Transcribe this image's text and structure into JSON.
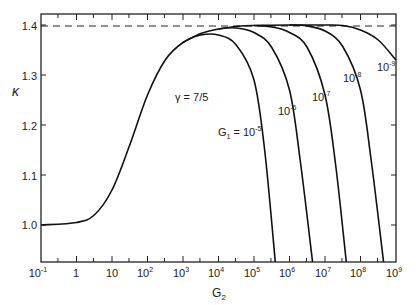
{
  "chart_data": {
    "type": "line",
    "title": "",
    "xlabel": "G2",
    "ylabel": "κ",
    "xscale": "log",
    "xlim": [
      0.1,
      1000000000.0
    ],
    "ylim": [
      0.926,
      1.425
    ],
    "x_ticks": [
      "10^-1",
      "1",
      "10",
      "10^2",
      "10^3",
      "10^4",
      "10^5",
      "10^6",
      "10^7",
      "10^8",
      "10^9"
    ],
    "y_ticks": [
      "1.0",
      "1.1",
      "1.2",
      "1.3",
      "1.4"
    ],
    "grid": false,
    "reference_line": {
      "y": 1.4,
      "style": "dashed"
    },
    "annotations": [
      "γ = 7/5",
      "G1 = 10^-5",
      "10^-6",
      "10^-7",
      "10^-8",
      "10^-9"
    ],
    "series": [
      {
        "name": "G1 = 10^-5",
        "log10_x": [
          -1,
          0,
          0.5,
          1,
          1.5,
          2,
          2.5,
          3,
          3.5,
          4,
          4.5,
          5,
          5.3,
          5.6
        ],
        "y": [
          1.0,
          1.005,
          1.02,
          1.07,
          1.16,
          1.26,
          1.33,
          1.365,
          1.38,
          1.38,
          1.36,
          1.29,
          1.15,
          0.926
        ]
      },
      {
        "name": "G1 = 10^-6",
        "log10_x": [
          3,
          3.5,
          4,
          4.5,
          5,
          5.5,
          6,
          6.3,
          6.65
        ],
        "y": [
          1.365,
          1.383,
          1.392,
          1.394,
          1.385,
          1.355,
          1.27,
          1.13,
          0.926
        ]
      },
      {
        "name": "G1 = 10^-7",
        "log10_x": [
          4,
          4.5,
          5,
          5.5,
          6,
          6.5,
          7,
          7.3,
          7.6
        ],
        "y": [
          1.392,
          1.397,
          1.399,
          1.396,
          1.385,
          1.355,
          1.26,
          1.12,
          0.926
        ]
      },
      {
        "name": "G1 = 10^-8",
        "log10_x": [
          5,
          6,
          6.5,
          7,
          7.5,
          8,
          8.3,
          8.65
        ],
        "y": [
          1.399,
          1.4,
          1.398,
          1.388,
          1.357,
          1.27,
          1.13,
          0.926
        ]
      },
      {
        "name": "G1 = 10^-9",
        "log10_x": [
          6,
          7,
          7.5,
          8,
          8.5,
          9
        ],
        "y": [
          1.4,
          1.4,
          1.399,
          1.39,
          1.37,
          1.33
        ]
      }
    ]
  },
  "labels": {
    "y_axis": "κ",
    "x_axis": "G",
    "x_axis_sub": "2",
    "gamma": "γ = 7/5",
    "g1_prefix": "G",
    "g1_sub": "1",
    "g1_eq": " = 10",
    "ten": "10",
    "exp5": "-5",
    "exp6": "-6",
    "exp7": "-7",
    "exp8": "-8",
    "exp9": "-9"
  }
}
